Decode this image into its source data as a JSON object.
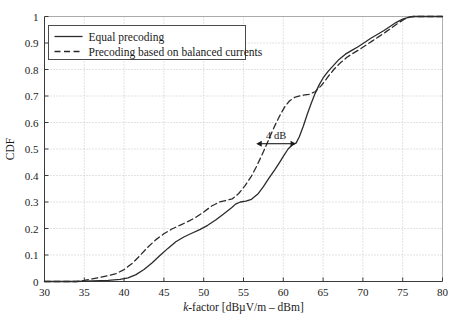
{
  "chart_data": {
    "type": "line",
    "title": "",
    "xlabel": "k-factor [dBµV/m – dBm]",
    "xlabel_italic_prefix": "k",
    "xlabel_rest": "-factor [dBµV/m – dBm]",
    "ylabel": "CDF",
    "xlim": [
      30,
      80
    ],
    "ylim": [
      0,
      1
    ],
    "xticks": [
      30,
      35,
      40,
      45,
      50,
      55,
      60,
      65,
      70,
      75,
      80
    ],
    "yticks": [
      0,
      0.1,
      0.2,
      0.3,
      0.4,
      0.5,
      0.6,
      0.7,
      0.8,
      0.9,
      1
    ],
    "xtick_labels": [
      "30",
      "35",
      "40",
      "45",
      "50",
      "55",
      "60",
      "65",
      "70",
      "75",
      "80"
    ],
    "ytick_labels": [
      "0",
      "0.1",
      "0.2",
      "0.3",
      "0.4",
      "0.5",
      "0.6",
      "0.7",
      "0.8",
      "0.9",
      "1"
    ],
    "grid": true,
    "grid_style": "dotted",
    "grid_color": "#b9b9b9",
    "axis_color": "#3a3a3a",
    "legend_position": "top-left",
    "series": [
      {
        "name": "Equal precoding",
        "style": "solid",
        "color": "#2b2b2b",
        "points": [
          [
            30.0,
            0.0
          ],
          [
            34.0,
            0.0
          ],
          [
            36.0,
            0.002
          ],
          [
            38.0,
            0.004
          ],
          [
            39.5,
            0.008
          ],
          [
            40.5,
            0.014
          ],
          [
            41.5,
            0.026
          ],
          [
            42.5,
            0.045
          ],
          [
            43.5,
            0.07
          ],
          [
            44.5,
            0.098
          ],
          [
            45.5,
            0.125
          ],
          [
            46.5,
            0.15
          ],
          [
            47.5,
            0.168
          ],
          [
            48.5,
            0.182
          ],
          [
            49.5,
            0.196
          ],
          [
            50.5,
            0.212
          ],
          [
            51.5,
            0.232
          ],
          [
            52.5,
            0.255
          ],
          [
            53.5,
            0.278
          ],
          [
            54.0,
            0.292
          ],
          [
            54.6,
            0.3
          ],
          [
            55.3,
            0.303
          ],
          [
            56.0,
            0.31
          ],
          [
            56.8,
            0.33
          ],
          [
            57.5,
            0.358
          ],
          [
            58.2,
            0.39
          ],
          [
            58.9,
            0.42
          ],
          [
            59.5,
            0.448
          ],
          [
            60.0,
            0.472
          ],
          [
            60.6,
            0.5
          ],
          [
            61.2,
            0.518
          ],
          [
            61.6,
            0.522
          ],
          [
            62.0,
            0.545
          ],
          [
            62.5,
            0.585
          ],
          [
            63.0,
            0.63
          ],
          [
            63.5,
            0.672
          ],
          [
            64.0,
            0.71
          ],
          [
            64.5,
            0.742
          ],
          [
            65.0,
            0.768
          ],
          [
            65.6,
            0.792
          ],
          [
            66.2,
            0.812
          ],
          [
            67.0,
            0.838
          ],
          [
            67.8,
            0.858
          ],
          [
            68.6,
            0.872
          ],
          [
            69.4,
            0.886
          ],
          [
            70.2,
            0.902
          ],
          [
            71.0,
            0.918
          ],
          [
            71.8,
            0.932
          ],
          [
            72.6,
            0.946
          ],
          [
            73.4,
            0.962
          ],
          [
            74.2,
            0.978
          ],
          [
            75.0,
            0.99
          ],
          [
            75.8,
            0.998
          ],
          [
            76.4,
            1.0
          ],
          [
            80.0,
            1.0
          ]
        ]
      },
      {
        "name": "Precoding based on balanced currents",
        "style": "dashed",
        "color": "#2b2b2b",
        "points": [
          [
            30.0,
            0.0
          ],
          [
            34.0,
            0.0
          ],
          [
            35.0,
            0.004
          ],
          [
            36.0,
            0.01
          ],
          [
            37.0,
            0.016
          ],
          [
            38.0,
            0.022
          ],
          [
            39.0,
            0.03
          ],
          [
            40.0,
            0.045
          ],
          [
            41.0,
            0.068
          ],
          [
            42.0,
            0.098
          ],
          [
            43.0,
            0.13
          ],
          [
            44.0,
            0.158
          ],
          [
            45.0,
            0.18
          ],
          [
            46.0,
            0.198
          ],
          [
            47.0,
            0.212
          ],
          [
            48.0,
            0.226
          ],
          [
            49.0,
            0.242
          ],
          [
            50.0,
            0.262
          ],
          [
            51.0,
            0.285
          ],
          [
            52.0,
            0.3
          ],
          [
            52.8,
            0.306
          ],
          [
            53.6,
            0.312
          ],
          [
            54.4,
            0.332
          ],
          [
            55.2,
            0.362
          ],
          [
            56.0,
            0.398
          ],
          [
            56.6,
            0.432
          ],
          [
            57.2,
            0.47
          ],
          [
            57.8,
            0.51
          ],
          [
            58.4,
            0.552
          ],
          [
            59.0,
            0.592
          ],
          [
            59.6,
            0.628
          ],
          [
            60.2,
            0.66
          ],
          [
            60.8,
            0.682
          ],
          [
            61.5,
            0.696
          ],
          [
            62.3,
            0.702
          ],
          [
            63.2,
            0.706
          ],
          [
            64.0,
            0.716
          ],
          [
            64.8,
            0.74
          ],
          [
            65.6,
            0.772
          ],
          [
            66.4,
            0.802
          ],
          [
            67.2,
            0.826
          ],
          [
            68.0,
            0.846
          ],
          [
            68.8,
            0.862
          ],
          [
            69.6,
            0.876
          ],
          [
            70.4,
            0.892
          ],
          [
            71.2,
            0.908
          ],
          [
            72.0,
            0.924
          ],
          [
            72.8,
            0.94
          ],
          [
            73.6,
            0.957
          ],
          [
            74.4,
            0.974
          ],
          [
            75.2,
            0.99
          ],
          [
            76.0,
            0.999
          ],
          [
            76.5,
            1.0
          ],
          [
            80.0,
            1.0
          ]
        ]
      }
    ],
    "annotations": [
      {
        "label": "4 dB",
        "type": "double-arrow",
        "x_start": 56.6,
        "x_end": 61.6,
        "y": 0.52
      }
    ]
  },
  "legend": {
    "entries": [
      {
        "label": "Equal precoding",
        "style": "solid"
      },
      {
        "label": "Precoding based on balanced currents",
        "style": "dashed"
      }
    ]
  }
}
